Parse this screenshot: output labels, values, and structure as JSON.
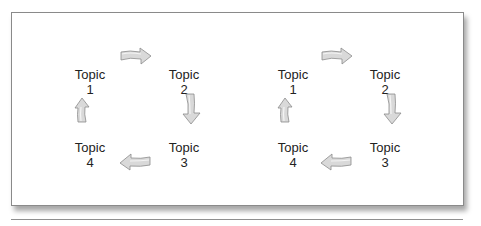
{
  "figure": {
    "frame_border_color": "#8a8a8a",
    "arrow_fill": "#d9d9d9",
    "arrow_stroke": "#8c8c8c",
    "text_color": "#222222"
  },
  "cycles": [
    {
      "topics": [
        {
          "label": "Topic",
          "number": "1"
        },
        {
          "label": "Topic",
          "number": "2"
        },
        {
          "label": "Topic",
          "number": "3"
        },
        {
          "label": "Topic",
          "number": "4"
        }
      ],
      "arrows": [
        "arrow-right-icon",
        "arrow-down-icon",
        "arrow-left-icon",
        "arrow-up-icon"
      ]
    },
    {
      "topics": [
        {
          "label": "Topic",
          "number": "1"
        },
        {
          "label": "Topic",
          "number": "2"
        },
        {
          "label": "Topic",
          "number": "3"
        },
        {
          "label": "Topic",
          "number": "4"
        }
      ],
      "arrows": [
        "arrow-right-icon",
        "arrow-down-icon",
        "arrow-left-icon",
        "arrow-up-icon"
      ]
    }
  ]
}
